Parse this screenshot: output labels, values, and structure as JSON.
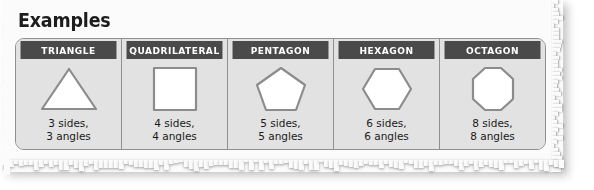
{
  "title": "Examples",
  "table": {
    "columns": [
      {
        "header": "TRIANGLE",
        "shape": "triangle-icon",
        "sides_line": "3 sides,",
        "angles_line": "3 angles"
      },
      {
        "header": "QUADRILATERAL",
        "shape": "square-icon",
        "sides_line": "4 sides,",
        "angles_line": "4 angles"
      },
      {
        "header": "PENTAGON",
        "shape": "pentagon-icon",
        "sides_line": "5 sides,",
        "angles_line": "5 angles"
      },
      {
        "header": "HEXAGON",
        "shape": "hexagon-icon",
        "sides_line": "6 sides,",
        "angles_line": "6 angles"
      },
      {
        "header": "OCTAGON",
        "shape": "octagon-icon",
        "sides_line": "8 sides,",
        "angles_line": "8 angles"
      }
    ]
  },
  "colors": {
    "paper": "#fbfbfb",
    "cell_background": "#e2e2e2",
    "header_background": "#4a4a4a",
    "header_text": "#ffffff",
    "border": "#8f8f8f",
    "shape_fill": "#ffffff",
    "shape_stroke": "#8c8c8c",
    "body_text": "#1a1a1a"
  }
}
